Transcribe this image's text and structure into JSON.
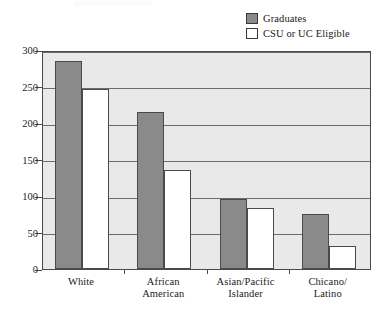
{
  "chart_data": {
    "type": "bar",
    "title": "",
    "subtitle": "",
    "xlabel": "",
    "ylabel": "",
    "categories": [
      "White",
      "African\nAmerican",
      "Asian/Pacific\nIslander",
      "Chicano/\nLatino"
    ],
    "series": [
      {
        "name": "Graduates",
        "values": [
          285,
          215,
          96,
          75
        ],
        "color": "#8a8a8a"
      },
      {
        "name": "CSU or UC Eligible",
        "values": [
          247,
          135,
          84,
          32
        ],
        "color": "#ffffff"
      }
    ],
    "ylim": [
      0,
      300
    ],
    "yticks": [
      0,
      50,
      100,
      150,
      200,
      250,
      300
    ],
    "ytick_labels": [
      "0",
      "50",
      "100",
      "150",
      "200",
      "250",
      "300"
    ],
    "grid": true,
    "grid_axis": "y",
    "legend_position": "top-right",
    "plot_background": "#e9e9e9",
    "axis_color": "#4a4a4a"
  },
  "legend": {
    "items": [
      {
        "label": "Graduates",
        "swatch": "graduates-swatch"
      },
      {
        "label": "CSU or UC Eligible",
        "swatch": "eligible-swatch"
      }
    ]
  },
  "yaxis": {
    "labels": [
      "300",
      "250",
      "200",
      "150",
      "100",
      "50",
      "0"
    ]
  },
  "xaxis": {
    "labels": [
      "White",
      "African\nAmerican",
      "Asian/Pacific\nIslander",
      "Chicano/\nLatino"
    ]
  }
}
